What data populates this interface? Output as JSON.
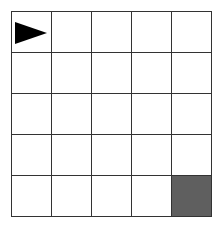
{
  "grid": {
    "rows": 5,
    "cols": 5,
    "agent": {
      "row": 0,
      "col": 0,
      "direction": "right",
      "icon": "triangle-right-icon"
    },
    "goal": {
      "row": 4,
      "col": 4,
      "color": "#5f5f5f"
    },
    "line_color": "#333333",
    "background": "#ffffff"
  }
}
